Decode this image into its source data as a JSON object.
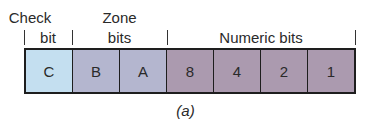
{
  "labels": {
    "check_line1": "Check",
    "check_line2": "bit",
    "zone_line1": "Zone",
    "zone_line2": "bits",
    "numeric": "Numeric bits"
  },
  "cells": [
    {
      "label": "C",
      "group": "check",
      "color": "#c4dff0"
    },
    {
      "label": "B",
      "group": "zone",
      "color": "#b4b6cf"
    },
    {
      "label": "A",
      "group": "zone",
      "color": "#b4b6cf"
    },
    {
      "label": "8",
      "group": "numeric",
      "color": "#ab9aaf"
    },
    {
      "label": "4",
      "group": "numeric",
      "color": "#ab9aaf"
    },
    {
      "label": "2",
      "group": "numeric",
      "color": "#ab9aaf"
    },
    {
      "label": "1",
      "group": "numeric",
      "color": "#ab9aaf"
    }
  ],
  "caption": "(a)"
}
